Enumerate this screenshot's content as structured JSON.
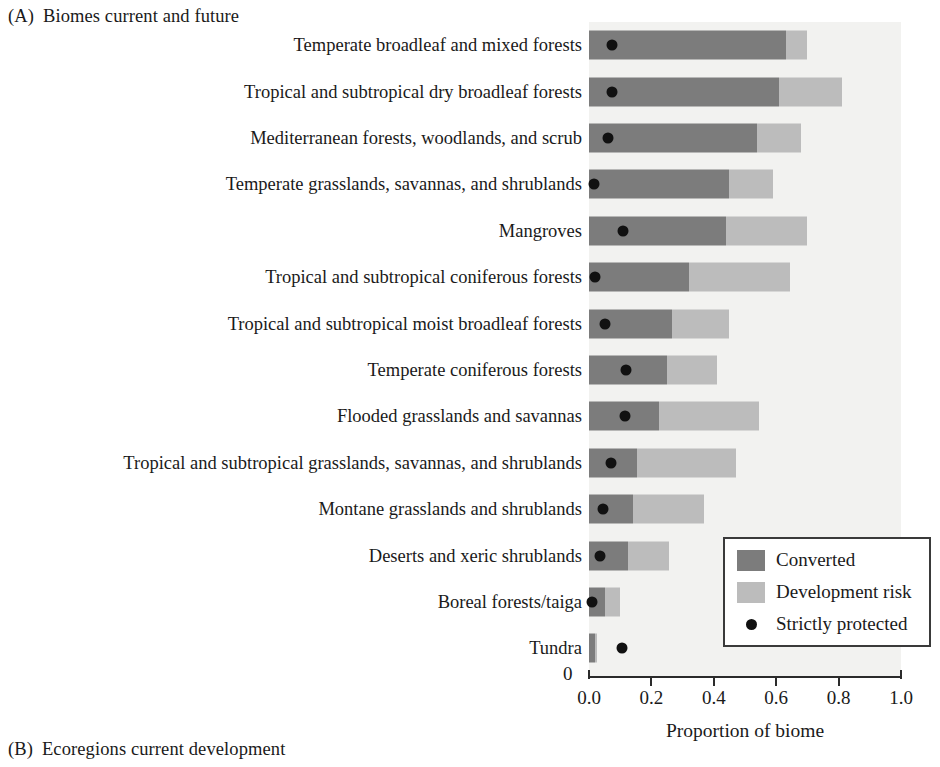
{
  "panel_a": {
    "tag": "(A)",
    "title": "Biomes current and future"
  },
  "panel_b": {
    "tag": "(B)",
    "title": "Ecoregions current development"
  },
  "axis": {
    "x_title": "Proportion of biome",
    "origin_label": "0",
    "tick_labels": [
      "0.0",
      "0.2",
      "0.4",
      "0.6",
      "0.8",
      "1.0"
    ]
  },
  "legend": {
    "converted": "Converted",
    "development_risk": "Development risk",
    "strictly_protected": "Strictly protected"
  },
  "colors": {
    "converted": "#7c7c7c",
    "development_risk": "#bcbcbc",
    "strictly_protected": "#111111",
    "plot_background": "#f2f2f0",
    "axis": "#2b2b2b"
  },
  "chart_data": {
    "type": "bar",
    "orientation": "horizontal",
    "stacked": true,
    "title": "Biomes current and future",
    "xlabel": "Proportion of biome",
    "ylabel": "",
    "xlim": [
      0.0,
      1.0
    ],
    "xticks": [
      0.0,
      0.2,
      0.4,
      0.6,
      0.8,
      1.0
    ],
    "grid": false,
    "legend_position": "bottom-right-inside",
    "categories": [
      "Temperate broadleaf and mixed forests",
      "Tropical and subtropical dry broadleaf forests",
      "Mediterranean forests, woodlands, and scrub",
      "Temperate grasslands, savannas, and shrublands",
      "Mangroves",
      "Tropical and subtropical coniferous forests",
      "Tropical and subtropical moist broadleaf forests",
      "Temperate coniferous forests",
      "Flooded grasslands and savannas",
      "Tropical and subtropical grasslands, savannas, and shrublands",
      "Montane grasslands and shrublands",
      "Deserts and xeric shrublands",
      "Boreal forests/taiga",
      "Tundra"
    ],
    "series": [
      {
        "name": "Converted",
        "values": [
          0.63,
          0.61,
          0.54,
          0.45,
          0.44,
          0.32,
          0.265,
          0.25,
          0.225,
          0.155,
          0.14,
          0.125,
          0.05,
          0.02
        ]
      },
      {
        "name": "Development risk",
        "values": [
          0.07,
          0.2,
          0.14,
          0.14,
          0.26,
          0.325,
          0.185,
          0.16,
          0.32,
          0.315,
          0.23,
          0.13,
          0.05,
          0.005
        ]
      },
      {
        "name": "Strictly protected",
        "type": "point",
        "values": [
          0.075,
          0.075,
          0.06,
          0.015,
          0.11,
          0.02,
          0.05,
          0.12,
          0.115,
          0.07,
          0.045,
          0.035,
          0.01,
          0.105
        ]
      }
    ],
    "totals": [
      0.7,
      0.81,
      0.68,
      0.59,
      0.7,
      0.645,
      0.45,
      0.41,
      0.545,
      0.47,
      0.37,
      0.255,
      0.1,
      0.025
    ]
  }
}
